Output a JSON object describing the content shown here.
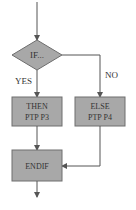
{
  "diagram": {
    "type": "flowchart",
    "colors": {
      "box_fill": "#a8a8a8",
      "box_stroke": "#6e6e6e",
      "line": "#555555",
      "text": "#333333"
    },
    "nodes": {
      "decision": {
        "label": "IF..."
      },
      "then_box": {
        "line1": "THEN",
        "line2": "PTP P3"
      },
      "else_box": {
        "line1": "ELSE",
        "line2": "PTP P4"
      },
      "endif_box": {
        "label": "ENDIF"
      }
    },
    "edges": {
      "yes_label": "YES",
      "no_label": "NO"
    }
  }
}
